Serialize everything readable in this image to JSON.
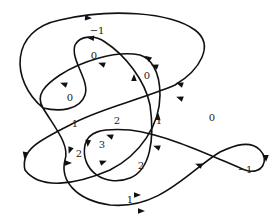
{
  "figure": {
    "stroke_color": "#111111",
    "background": "#ffffff"
  },
  "curve_segments": [
    {
      "id": "s1",
      "d": "M 62 88 C 20 55, 15 18, 120 12 C 200 8, 280 40, 180 82"
    },
    {
      "id": "s2",
      "d": "M 180 82 C 150 95, 110 105, 85 115 C 50 128, 15 140, 25 162 C 35 182, 80 185, 112 172"
    },
    {
      "id": "s3",
      "d": "M 112 172 C 140 160, 160 130, 163 100 C 166 70, 150 55, 140 52"
    },
    {
      "id": "s4",
      "d": "M 140 52 C 110 45, 70 65, 50 80 C 35 92, 30 96, 62 88"
    },
    {
      "id": "s5",
      "d": "M 62 88 C 95 78, 95 30, 88 38 C 75 30, 70 60, 80 75 C 90 90, 92 100, 85 115"
    },
    {
      "id": "s6",
      "d": "M 85 115 C 78 140, 95 165, 115 180 C 135 196, 170 200, 195 180 C 215 160, 205 110, 185 75 C 170 50, 130 35, 110 40"
    },
    {
      "id": "s7",
      "d": "M 110 40 C 130 35, 170 50, 185 75"
    },
    {
      "id": "s8",
      "d": "M 195 180 C 215 170, 235 158, 250 150 C 262 142, 268 152, 262 165 C 255 178, 235 170, 220 162 C 180 145, 130 125, 100 135 C 65 148, 60 185, 110 205 C 160 222, 205 205, 225 180 C 240 162, 250 150, 255 145"
    }
  ],
  "arrows": [
    {
      "x": 88,
      "y": 18,
      "angle": 5
    },
    {
      "x": 91,
      "y": 38,
      "angle": 185
    },
    {
      "x": 102,
      "y": 64,
      "angle": 200
    },
    {
      "x": 64,
      "y": 84,
      "angle": 200
    },
    {
      "x": 155,
      "y": 66,
      "angle": 200
    },
    {
      "x": 148,
      "y": 58,
      "angle": 215
    },
    {
      "x": 134,
      "y": 78,
      "angle": 270
    },
    {
      "x": 180,
      "y": 84,
      "angle": 200
    },
    {
      "x": 25,
      "y": 155,
      "angle": 100
    },
    {
      "x": 68,
      "y": 163,
      "angle": 0
    },
    {
      "x": 103,
      "y": 162,
      "angle": 340
    },
    {
      "x": 70,
      "y": 150,
      "angle": 110
    },
    {
      "x": 88,
      "y": 143,
      "angle": 95
    },
    {
      "x": 110,
      "y": 136,
      "angle": 200
    },
    {
      "x": 158,
      "y": 117,
      "angle": 275
    },
    {
      "x": 157,
      "y": 147,
      "angle": 200
    },
    {
      "x": 199,
      "y": 165,
      "angle": 200
    },
    {
      "x": 266,
      "y": 158,
      "angle": 90
    },
    {
      "x": 137,
      "y": 195,
      "angle": 0
    },
    {
      "x": 141,
      "y": 211,
      "angle": 0
    },
    {
      "x": 180,
      "y": 98,
      "angle": 200
    }
  ],
  "region_labels": [
    {
      "text": "−1",
      "x": 97,
      "y": 31
    },
    {
      "text": "0",
      "x": 94,
      "y": 56
    },
    {
      "text": "0",
      "x": 70,
      "y": 98
    },
    {
      "text": "0",
      "x": 147,
      "y": 76
    },
    {
      "text": "0",
      "x": 212,
      "y": 118
    },
    {
      "text": "1",
      "x": 75,
      "y": 124
    },
    {
      "text": "2",
      "x": 117,
      "y": 121
    },
    {
      "text": "1",
      "x": 159,
      "y": 121
    },
    {
      "text": "3",
      "x": 102,
      "y": 145
    },
    {
      "text": "2",
      "x": 79,
      "y": 154
    },
    {
      "text": "2",
      "x": 141,
      "y": 166
    },
    {
      "text": "−1",
      "x": 245,
      "y": 170
    },
    {
      "text": "1",
      "x": 130,
      "y": 200
    }
  ]
}
